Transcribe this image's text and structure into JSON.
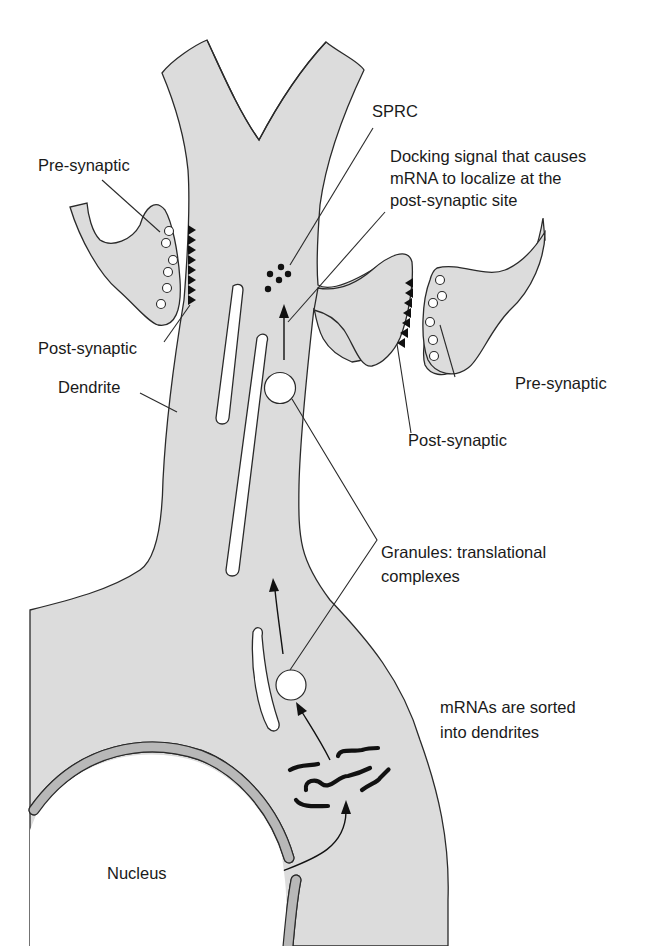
{
  "figure": {
    "colors": {
      "cytoplasm": "#dcdcdc",
      "outline": "#2a2a2a",
      "nuclear_envelope": "#b8b8b8",
      "background": "#ffffff"
    }
  },
  "labels": {
    "pre_synaptic_left": "Pre-synaptic",
    "post_synaptic_left": "Post-synaptic",
    "dendrite": "Dendrite",
    "sprc": "SPRC",
    "docking_signal": "Docking signal that causes\nmRNA to localize at the\npost-synaptic site",
    "pre_synaptic_right": "Pre-synaptic",
    "post_synaptic_right": "Post-synaptic",
    "granules": "Granules: translational\ncomplexes",
    "mrnas_sorted": "mRNAs are sorted\ninto dendrites",
    "nucleus": "Nucleus"
  }
}
